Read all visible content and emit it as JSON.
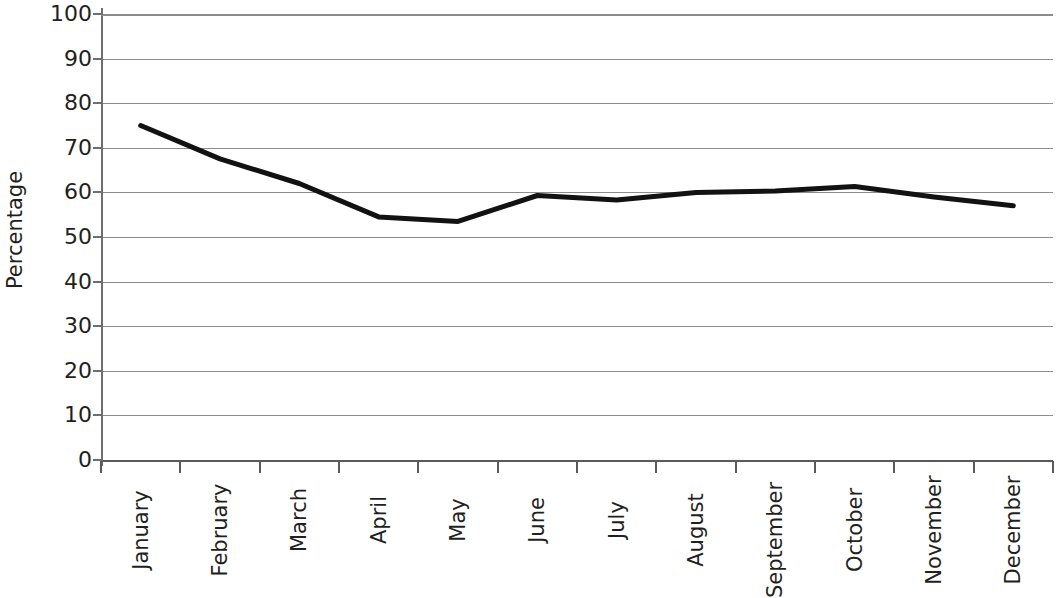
{
  "chart_data": {
    "type": "line",
    "title": "",
    "subtitle": "",
    "xlabel": "",
    "ylabel": "Percentage",
    "categories": [
      "January",
      "February",
      "March",
      "April",
      "May",
      "June",
      "July",
      "August",
      "September",
      "October",
      "November",
      "December"
    ],
    "values": [
      75,
      67.5,
      62,
      54.5,
      53.5,
      59.3,
      58.3,
      60,
      60.3,
      61.3,
      59,
      57
    ],
    "series": [
      {
        "name": "Percentage",
        "values": [
          75,
          67.5,
          62,
          54.5,
          53.5,
          59.3,
          58.3,
          60,
          60.3,
          61.3,
          59,
          57
        ]
      }
    ],
    "ylim": [
      0,
      100
    ],
    "y_ticks": [
      100,
      90,
      80,
      70,
      60,
      50,
      40,
      30,
      20,
      10,
      0
    ],
    "y_tick_labels": [
      "100",
      "90",
      "80",
      "70",
      "60",
      "50",
      "40",
      "30",
      "20",
      "10",
      "0"
    ],
    "grid": true,
    "grid_axis": "y",
    "legend": false,
    "legend_position": "none",
    "annotations": [],
    "line_color": "#121212",
    "grid_color": "#8c8c8c",
    "axis_color": "#5a5a5a",
    "text_color": "#231f20",
    "line_width_px": 5,
    "markers": false
  }
}
